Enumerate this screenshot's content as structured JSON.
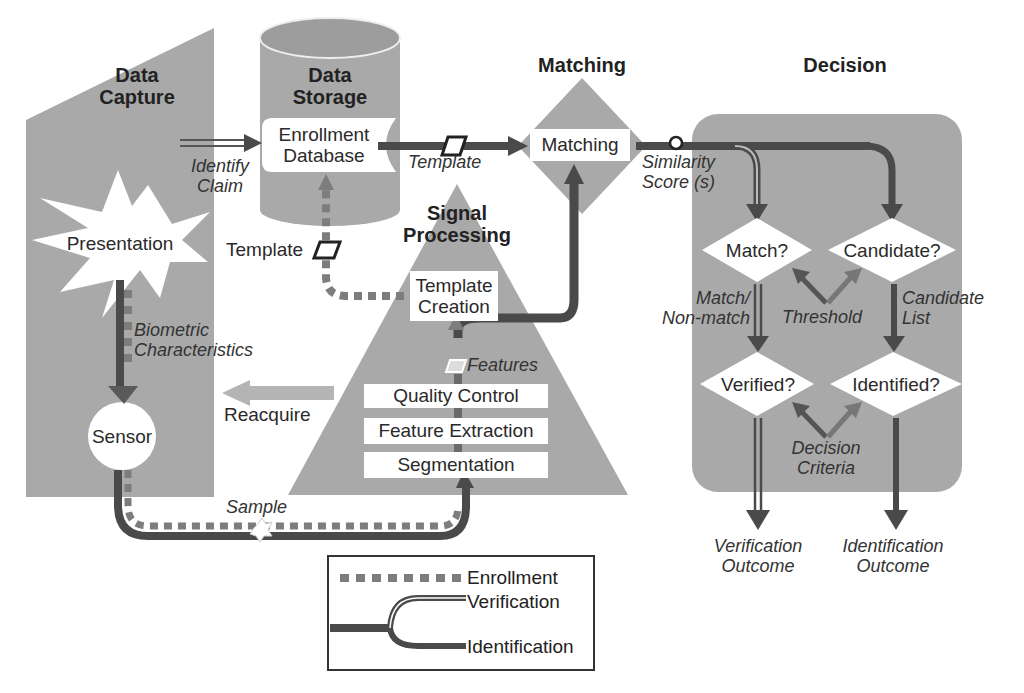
{
  "sections": {
    "data_capture": "Data\nCapture",
    "data_capture_l1": "Data",
    "data_capture_l2": "Capture",
    "data_storage_l1": "Data",
    "data_storage_l2": "Storage",
    "matching": "Matching",
    "signal_processing_l1": "Signal",
    "signal_processing_l2": "Processing",
    "decision": "Decision"
  },
  "nodes": {
    "presentation": "Presentation",
    "sensor": "Sensor",
    "enrollment_db_l1": "Enrollment",
    "enrollment_db_l2": "Database",
    "matching_box": "Matching",
    "template_creation_l1": "Template",
    "template_creation_l2": "Creation",
    "quality_control": "Quality Control",
    "feature_extraction": "Feature Extraction",
    "segmentation": "Segmentation",
    "match_q": "Match?",
    "candidate_q": "Candidate?",
    "verified_q": "Verified?",
    "identified_q": "Identified?"
  },
  "labels": {
    "identify_claim_l1": "Identify",
    "identify_claim_l2": "Claim",
    "template_top": "Template",
    "template_left": "Template",
    "similarity_l1": "Similarity",
    "similarity_l2": "Score (s)",
    "biometric_l1": "Biometric",
    "biometric_l2": "Characteristics",
    "reacquire": "Reacquire",
    "sample": "Sample",
    "features": "Features",
    "match_nonmatch_l1": "Match/",
    "match_nonmatch_l2": "Non-match",
    "threshold": "Threshold",
    "candidate_list_l1": "Candidate",
    "candidate_list_l2": "List",
    "decision_criteria_l1": "Decision",
    "decision_criteria_l2": "Criteria",
    "verification_outcome_l1": "Verification",
    "verification_outcome_l2": "Outcome",
    "identification_outcome_l1": "Identification",
    "identification_outcome_l2": "Outcome"
  },
  "legend": {
    "enrollment": "Enrollment",
    "verification": "Verification",
    "identification": "Identification"
  },
  "colors": {
    "region_gray": "#a9a9a9",
    "dark_line": "#4a4a4a",
    "enroll_dash": "#7d7d7d",
    "white": "#ffffff"
  }
}
